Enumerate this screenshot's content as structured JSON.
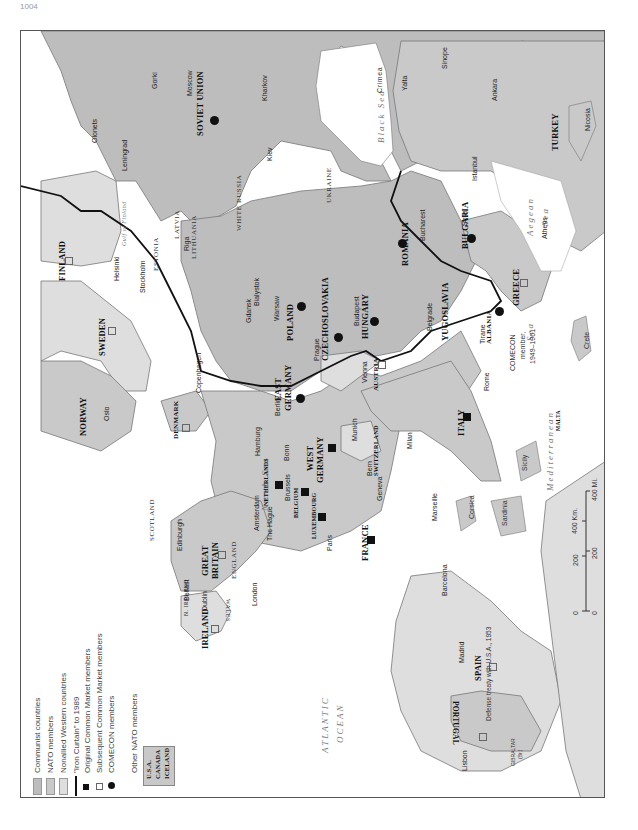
{
  "page": {
    "number": "1004"
  },
  "map": {
    "orientation": "rotated -90deg",
    "colors": {
      "communist": "#bdbdbd",
      "nato": "#c9c9c9",
      "nonallied": "#dedede",
      "water": "#ffffff",
      "border": "#777777",
      "iron_curtain": "#111111"
    },
    "seas": {
      "black_sea": "Black Sea",
      "north_sea": "North Sea",
      "atlantic": "ATLANTIC",
      "ocean": "OCEAN",
      "mediterranean": "Mediterranean",
      "med_sea": "Sea",
      "aegean": "Aegean",
      "aegean_sea": "Sea",
      "gulf_finland": "Gulf of Finland"
    },
    "countries": {
      "soviet_union": "SOVIET UNION",
      "finland": "FINLAND",
      "sweden": "SWEDEN",
      "norway": "NORWAY",
      "denmark": "DENMARK",
      "poland": "POLAND",
      "east_germany": "EAST",
      "east_germany2": "GERMANY",
      "west_germany": "WEST",
      "west_germany2": "GERMANY",
      "czechoslovakia": "CZECHOSLOVAKIA",
      "hungary": "HUNGARY",
      "romania": "ROMANIA",
      "bulgaria": "BULGARIA",
      "yugoslavia": "YUGOSLAVIA",
      "albania": "ALBANIA",
      "greece": "GREECE",
      "turkey": "TURKEY",
      "cyprus": "CYPRUS",
      "austria": "AUSTRIA",
      "switzerland": "SWITZERLAND",
      "italy": "ITALY",
      "france": "FRANCE",
      "spain": "SPAIN",
      "portugal": "PORTUGAL",
      "netherlands": "NETHERLANDS",
      "belgium": "BELGIUM",
      "luxembourg": "LUXEMBOURG",
      "great_britain": "GREAT",
      "great_britain2": "BRITAIN",
      "ireland": "IRELAND",
      "malta": "MALTA"
    },
    "regions": {
      "estonia": "ESTONIA",
      "latvia": "LATVIA",
      "lithuania": "LITHUANIA",
      "white_russia": "WHITE RUSSIA",
      "ukraine": "UKRAINE",
      "crimea": "Crimea",
      "scotland": "SCOTLAND",
      "england": "ENGLAND",
      "wales": "WALES",
      "n_ireland": "N. IRELAND",
      "corsica": "Corsica",
      "sardinia": "Sardinia",
      "sicily": "Sicily",
      "crete": "Crete",
      "gibraltar": "GIBRALTAR",
      "gibraltar_note": "(Br.)"
    },
    "cities": {
      "olonets": "Olonets",
      "leningrad": "Leningrad",
      "gorki": "Gorki",
      "moscow": "Moscow",
      "kharkov": "Kharkov",
      "kiev": "Kiev",
      "yalta": "Yalta",
      "sinope": "Sinope",
      "ankara": "Ankara",
      "nicosia": "Nicosia",
      "istanbul": "Istanbul",
      "bucharest": "Bucharest",
      "sofia": "Sofia",
      "athens": "Athens",
      "belgrade": "Belgrade",
      "tirane": "Tirane",
      "budapest": "Budapest",
      "vienna": "Vienna",
      "prague": "Prague",
      "warsaw": "Warsaw",
      "bialystok": "Bialystok",
      "gdansk": "Gdansk",
      "riga": "Riga",
      "helsinki": "Helsinki",
      "stockholm": "Stockholm",
      "oslo": "Oslo",
      "copenhagen": "Copenhagen",
      "berlin": "Berlin",
      "hamburg": "Hamburg",
      "bonn": "Bonn",
      "munich": "Munich",
      "milan": "Milan",
      "rome": "Rome",
      "bern": "Bern",
      "geneva": "Geneva",
      "marseille": "Marseille",
      "barcelona": "Barcelona",
      "madrid": "Madrid",
      "lisbon": "Lisbon",
      "paris": "Paris",
      "brussels": "Brussels",
      "amsterdam": "Amsterdam",
      "the_hague": "The Hague",
      "london": "London",
      "edinburgh": "Edinburgh",
      "belfast": "Belfast",
      "dublin": "Dublin"
    },
    "notes": {
      "comecon_1": "COMECON",
      "comecon_2": "member,",
      "comecon_3": "1949–1961",
      "spain_treaty": "Defense treaty with U.S.A., 1953"
    },
    "scale": {
      "km_label": "400 Km.",
      "km_ticks": [
        "0",
        "200"
      ],
      "mi_label": "400 Mi.",
      "mi_ticks": [
        "0",
        "200"
      ]
    }
  },
  "legend": {
    "items": [
      {
        "label": "Communist countries",
        "symbol": "swatch-communist"
      },
      {
        "label": "NATO members",
        "symbol": "swatch-nato"
      },
      {
        "label": "Nonallied Western countries",
        "symbol": "swatch-nonallied"
      },
      {
        "label": "\"Iron Curtain\" to 1989",
        "symbol": "line"
      },
      {
        "label": "Original Common Market members",
        "symbol": "filled-square"
      },
      {
        "label": "Subsequent Common Market members",
        "symbol": "open-square"
      },
      {
        "label": "COMECON members",
        "symbol": "filled-circle"
      }
    ],
    "other_nato": {
      "title": "Other NATO members",
      "members": [
        "U.S.A.",
        "CANADA",
        "ICELAND"
      ]
    }
  }
}
